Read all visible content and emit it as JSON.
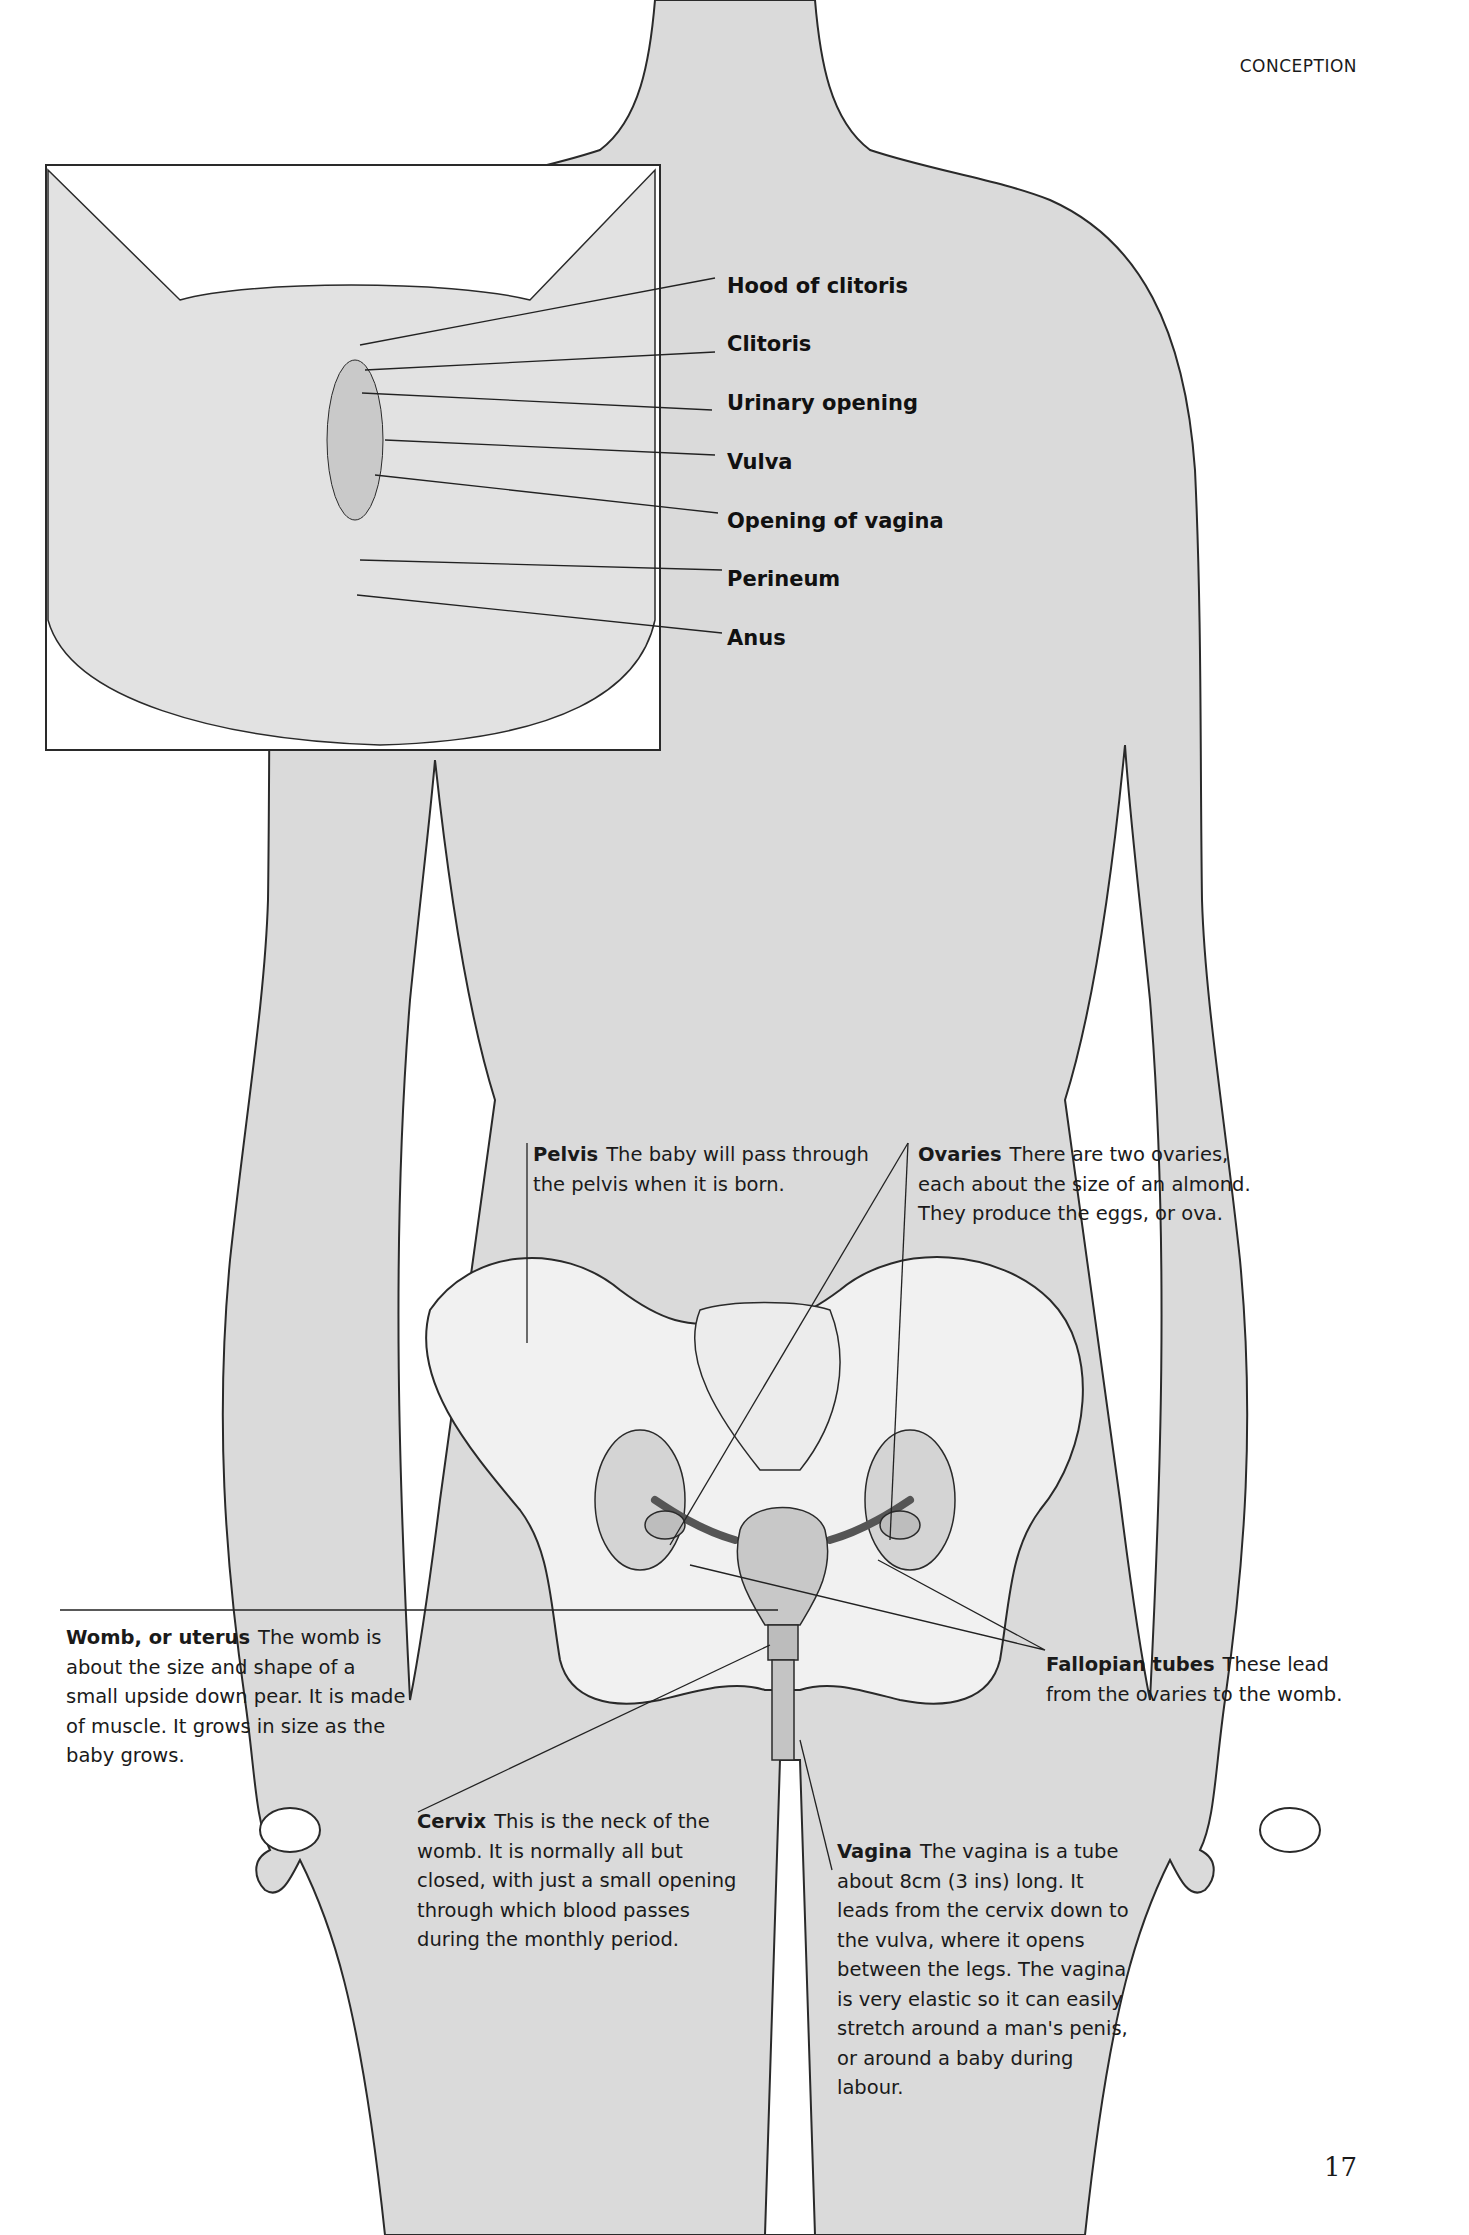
{
  "page": {
    "running_head": "CONCEPTION",
    "page_number": "17"
  },
  "inset": {
    "labels": [
      {
        "id": "hood-of-clitoris",
        "text": "Hood of clitoris"
      },
      {
        "id": "clitoris",
        "text": "Clitoris"
      },
      {
        "id": "urinary-opening",
        "text": "Urinary opening"
      },
      {
        "id": "vulva",
        "text": "Vulva"
      },
      {
        "id": "opening-of-vagina",
        "text": "Opening of vagina"
      },
      {
        "id": "perineum",
        "text": "Perineum"
      },
      {
        "id": "anus",
        "text": "Anus"
      }
    ]
  },
  "callouts": {
    "pelvis": {
      "term": "Pelvis",
      "text": "The baby will pass through the pelvis when it is born."
    },
    "ovaries": {
      "term": "Ovaries",
      "text": "There are two ovaries, each about the size of an almond. They produce the eggs, or ova."
    },
    "womb": {
      "term": "Womb, or uterus",
      "text": "The womb is about the size and shape of a small upside down pear. It is made of muscle. It grows in size as the baby grows."
    },
    "fallopian_tubes": {
      "term": "Fallopian tubes",
      "text": "These lead from the ovaries to the womb."
    },
    "cervix": {
      "term": "Cervix",
      "text": "This is the neck of the womb. It is normally all but closed, with just a small opening through which blood passes during the monthly period."
    },
    "vagina": {
      "term": "Vagina",
      "text": "The vagina is a tube about 8cm (3 ins) long. It leads from the cervix down to the vulva, where it opens between the legs. The vagina is very elastic so it can easily stretch around a man's penis, or around a baby during labour."
    }
  },
  "colors": {
    "silhouette": "#d9d9d9",
    "outline": "#2a2a2a",
    "bone": "#efefef",
    "paper": "#ffffff"
  }
}
